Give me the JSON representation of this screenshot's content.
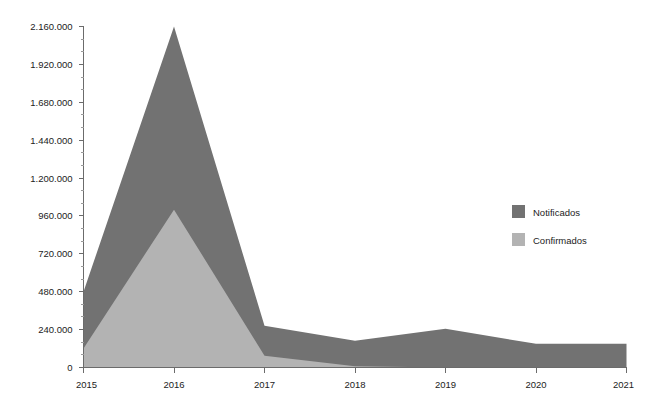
{
  "chart_data": {
    "type": "area",
    "title": "",
    "subtitle": "",
    "xlabel": "",
    "ylabel": "",
    "categories": [
      "2015",
      "2016",
      "2017",
      "2018",
      "2019",
      "2020",
      "2021"
    ],
    "x": [
      2015,
      2016,
      2017,
      2018,
      2019,
      2020,
      2021
    ],
    "xlim": [
      2015,
      2021
    ],
    "ylim": [
      0,
      2160000
    ],
    "grid": false,
    "stacked": false,
    "legend_position": "right-middle",
    "y_ticks": [
      0,
      240000,
      480000,
      720000,
      960000,
      1200000,
      1440000,
      1680000,
      1920000,
      2160000
    ],
    "y_tick_labels": [
      "0",
      "240.000",
      "480.000",
      "720.000",
      "960.000",
      "1.200.000",
      "1.440.000",
      "1.680.000",
      "1.920.000",
      "2.160.000"
    ],
    "y_minor_ticks_per_interval": 2,
    "x_tick_labels": [
      "2015",
      "2016",
      "2017",
      "2018",
      "2019",
      "2020",
      "2021"
    ],
    "series": [
      {
        "name": "Notificados",
        "color": "#727272",
        "values": [
          480000,
          2160000,
          265000,
          170000,
          245000,
          150000,
          150000
        ]
      },
      {
        "name": "Confirmados",
        "color": "#b3b3b3",
        "values": [
          120000,
          1000000,
          75000,
          8000,
          0,
          0,
          0
        ]
      }
    ]
  },
  "legend": {
    "items": [
      {
        "label": "Notificados",
        "color": "#727272"
      },
      {
        "label": "Confirmados",
        "color": "#b3b3b3"
      }
    ]
  },
  "colors": {
    "notificados": "#727272",
    "confirmados": "#b3b3b3",
    "axis": "#6b6b6b",
    "tick_minor": "#9a9a9a",
    "text": "#1c1c1c",
    "background": "#ffffff"
  }
}
